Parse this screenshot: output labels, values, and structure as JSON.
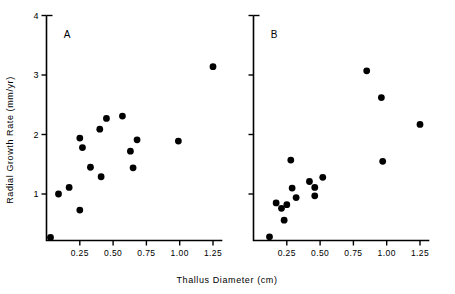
{
  "figure": {
    "xlabel": "Thallus  Diameter   (cm)",
    "ylabel": "Radial  Growth  Rate  (mm/yr)",
    "panel_a_letter": "A",
    "panel_b_letter": "B"
  },
  "chart_data": [
    {
      "type": "scatter",
      "panel": "A",
      "title": "A",
      "xlabel": "Thallus Diameter (cm)",
      "ylabel": "Radial Growth Rate (mm/yr)",
      "xlim": [
        0,
        1.32
      ],
      "ylim": [
        0.2,
        4.0
      ],
      "xticks": [
        0.25,
        0.5,
        0.75,
        1.0,
        1.25
      ],
      "xticklabels": [
        "0.25",
        "0.50",
        "0.75",
        "1.00",
        "1.25"
      ],
      "yticks": [
        1,
        2,
        3,
        4
      ],
      "yticklabels": [
        "1",
        "2",
        "3",
        "4"
      ],
      "grid": false,
      "legend": "none",
      "marker": "filled-circle",
      "points": [
        {
          "x": 0.03,
          "y": 0.27
        },
        {
          "x": 0.09,
          "y": 1.0
        },
        {
          "x": 0.17,
          "y": 1.11
        },
        {
          "x": 0.25,
          "y": 0.73
        },
        {
          "x": 0.25,
          "y": 1.94
        },
        {
          "x": 0.27,
          "y": 1.78
        },
        {
          "x": 0.33,
          "y": 1.45
        },
        {
          "x": 0.4,
          "y": 2.09
        },
        {
          "x": 0.41,
          "y": 1.29
        },
        {
          "x": 0.45,
          "y": 2.27
        },
        {
          "x": 0.57,
          "y": 2.31
        },
        {
          "x": 0.63,
          "y": 1.72
        },
        {
          "x": 0.65,
          "y": 1.44
        },
        {
          "x": 0.68,
          "y": 1.91
        },
        {
          "x": 0.99,
          "y": 1.89
        },
        {
          "x": 1.25,
          "y": 3.14
        }
      ]
    },
    {
      "type": "scatter",
      "panel": "B",
      "title": "B",
      "xlabel": "Thallus Diameter (cm)",
      "ylabel": "Radial Growth Rate (mm/yr)",
      "xlim": [
        0,
        1.32
      ],
      "ylim": [
        0.2,
        4.0
      ],
      "xticks": [
        0.25,
        0.5,
        0.75,
        1.0,
        1.25
      ],
      "xticklabels": [
        "0.25",
        "0.50",
        "0.75",
        "1.00",
        "1.25"
      ],
      "yticks": [
        1,
        2,
        3,
        4
      ],
      "yticklabels": [
        "",
        "",
        "",
        ""
      ],
      "grid": false,
      "legend": "none",
      "marker": "filled-circle",
      "points": [
        {
          "x": 0.12,
          "y": 0.28
        },
        {
          "x": 0.17,
          "y": 0.85
        },
        {
          "x": 0.21,
          "y": 0.76
        },
        {
          "x": 0.23,
          "y": 0.56
        },
        {
          "x": 0.25,
          "y": 0.82
        },
        {
          "x": 0.28,
          "y": 1.57
        },
        {
          "x": 0.29,
          "y": 1.1
        },
        {
          "x": 0.32,
          "y": 0.94
        },
        {
          "x": 0.42,
          "y": 1.21
        },
        {
          "x": 0.46,
          "y": 1.11
        },
        {
          "x": 0.46,
          "y": 0.97
        },
        {
          "x": 0.52,
          "y": 1.28
        },
        {
          "x": 0.85,
          "y": 3.07
        },
        {
          "x": 0.96,
          "y": 2.62
        },
        {
          "x": 0.97,
          "y": 1.55
        },
        {
          "x": 1.25,
          "y": 2.17
        }
      ]
    }
  ]
}
